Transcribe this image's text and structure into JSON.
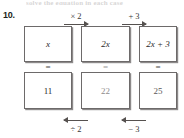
{
  "page": {
    "bleed_text": "solve the equation in each case"
  },
  "exercise": {
    "number": "10."
  },
  "machine": {
    "forward_ops": [
      {
        "label": "× 2",
        "direction": "right"
      },
      {
        "label": "+ 3",
        "direction": "right"
      }
    ],
    "inverse_ops": [
      {
        "label": "÷ 2",
        "direction": "left"
      },
      {
        "label": "− 3",
        "direction": "left"
      }
    ],
    "expression_row": [
      {
        "text": "x",
        "italic": true
      },
      {
        "text": "2x",
        "italic": true
      },
      {
        "text": "2x + 3",
        "italic": true
      }
    ],
    "relation_row": [
      "=",
      "=",
      "="
    ],
    "value_row": [
      {
        "text": "11"
      },
      {
        "text": "22"
      },
      {
        "text": "25"
      }
    ]
  }
}
